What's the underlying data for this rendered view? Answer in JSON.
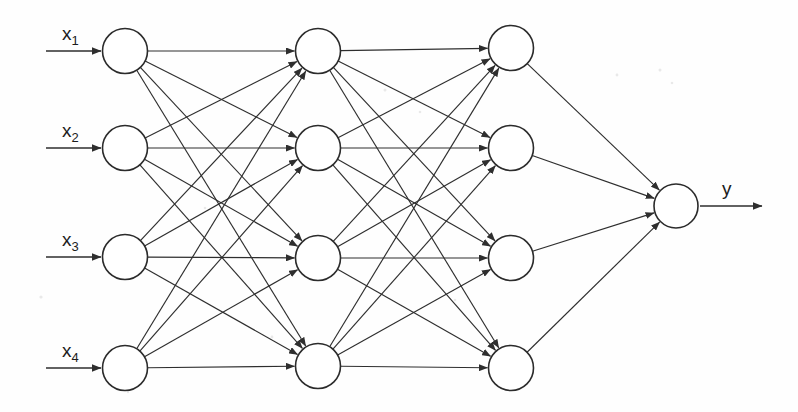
{
  "figure": {
    "type": "neural-network-diagram",
    "background_color": "#fefefe",
    "stroke_color": "#2e2e2e",
    "node_fill": "#ffffff"
  },
  "inputs": [
    {
      "id": "x1",
      "label": "x",
      "subscript": "1",
      "cx": 125,
      "cy": 51,
      "arrow_x1": 46,
      "arrow_x2": 101,
      "label_x": 62,
      "label_y": 40
    },
    {
      "id": "x2",
      "label": "x",
      "subscript": "2",
      "cx": 125,
      "cy": 148,
      "arrow_x1": 46,
      "arrow_x2": 101,
      "label_x": 62,
      "label_y": 137
    },
    {
      "id": "x3",
      "label": "x",
      "subscript": "3",
      "cx": 125,
      "cy": 257,
      "arrow_x1": 46,
      "arrow_x2": 101,
      "label_x": 62,
      "label_y": 246
    },
    {
      "id": "x4",
      "label": "x",
      "subscript": "4",
      "cx": 125,
      "cy": 368,
      "arrow_x1": 46,
      "arrow_x2": 101,
      "label_x": 62,
      "label_y": 357
    }
  ],
  "hidden1": [
    {
      "id": "h1_1",
      "cx": 318,
      "cy": 51
    },
    {
      "id": "h1_2",
      "cx": 318,
      "cy": 148
    },
    {
      "id": "h1_3",
      "cx": 318,
      "cy": 258
    },
    {
      "id": "h1_4",
      "cx": 318,
      "cy": 366
    }
  ],
  "hidden2": [
    {
      "id": "h2_1",
      "cx": 511,
      "cy": 48
    },
    {
      "id": "h2_2",
      "cx": 511,
      "cy": 148
    },
    {
      "id": "h2_3",
      "cx": 511,
      "cy": 258
    },
    {
      "id": "h2_4",
      "cx": 511,
      "cy": 368
    }
  ],
  "output": {
    "id": "y",
    "label": "y",
    "cx": 676,
    "cy": 206,
    "arrow_x1": 700,
    "arrow_x2": 762,
    "label_x": 722,
    "label_y": 195
  },
  "geometry": {
    "node_radius": 22.5,
    "output_radius": 22
  },
  "connections": {
    "input_to_hidden1": "fully-connected",
    "hidden1_to_hidden2": "fully-connected",
    "hidden2_to_output": "fully-connected"
  },
  "specks": [
    {
      "cx": 41,
      "cy": 297,
      "r": 1.6
    },
    {
      "cx": 385,
      "cy": 90,
      "r": 1.5
    },
    {
      "cx": 420,
      "cy": 112,
      "r": 1.3
    },
    {
      "cx": 617,
      "cy": 75,
      "r": 1.4
    },
    {
      "cx": 660,
      "cy": 70,
      "r": 1.5
    },
    {
      "cx": 672,
      "cy": 83,
      "r": 1.3
    },
    {
      "cx": 205,
      "cy": 208,
      "r": 1.3
    },
    {
      "cx": 272,
      "cy": 337,
      "r": 1.4
    },
    {
      "cx": 455,
      "cy": 300,
      "r": 1.3
    },
    {
      "cx": 128,
      "cy": 392,
      "r": 1.2
    }
  ]
}
